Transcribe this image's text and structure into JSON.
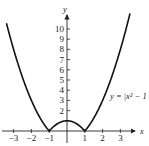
{
  "chart_data": {
    "type": "line",
    "title": "",
    "function": "y = |x^2 - 1|",
    "annotation": "y = |x² − 1",
    "xlabel": "x",
    "ylabel": "y",
    "xlim": [
      -3.4,
      3.6
    ],
    "ylim": [
      -0.6,
      11.5
    ],
    "x_ticks": [
      -3,
      -2,
      -1,
      1,
      2,
      3
    ],
    "x_tick_labels": [
      "−3",
      "−2",
      "−1",
      "1",
      "2",
      "3"
    ],
    "y_ticks": [
      2,
      3,
      4,
      5,
      6,
      7,
      8,
      9,
      10
    ],
    "y_tick_labels": [
      "2",
      "3",
      "4",
      "5",
      "6",
      "7",
      "8",
      "9",
      "10"
    ],
    "grid": false,
    "legend": null,
    "series": [
      {
        "name": "y = |x² − 1|",
        "x": [
          -3.3,
          -3,
          -2.5,
          -2,
          -1.5,
          -1,
          -0.5,
          0,
          0.5,
          1,
          1.5,
          2,
          2.5,
          3,
          3.3
        ],
        "y": [
          9.89,
          8,
          5.25,
          3,
          1.25,
          0,
          0.75,
          1,
          0.75,
          0,
          1.25,
          3,
          5.25,
          8,
          9.89
        ]
      }
    ]
  }
}
